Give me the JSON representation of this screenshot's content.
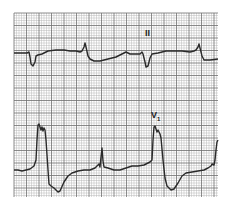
{
  "chart_data": {
    "type": "line",
    "title": "",
    "xlabel": "",
    "ylabel": "",
    "grid": true,
    "grid_area": {
      "x0": 14,
      "y0": 13,
      "x1": 218,
      "y1": 197,
      "minor_step": 2.5,
      "major_step": 12.5
    },
    "colors": {
      "grid_minor": "#b8b8b8",
      "grid_major": "#6e6e6e",
      "trace": "#2a2a2a",
      "paper": "#ffffff"
    },
    "series": [
      {
        "name": "II",
        "label": "II",
        "label_pos": {
          "x": 145,
          "y": 29
        },
        "points": [
          [
            14,
            53
          ],
          [
            27,
            53
          ],
          [
            29,
            52
          ],
          [
            30,
            57
          ],
          [
            31,
            64
          ],
          [
            33,
            66
          ],
          [
            35,
            62
          ],
          [
            36,
            56
          ],
          [
            38,
            55
          ],
          [
            42,
            54
          ],
          [
            48,
            51
          ],
          [
            56,
            50
          ],
          [
            64,
            50
          ],
          [
            70,
            51
          ],
          [
            76,
            51
          ],
          [
            80,
            52
          ],
          [
            82,
            51
          ],
          [
            84,
            47
          ],
          [
            85,
            43
          ],
          [
            86,
            47
          ],
          [
            88,
            56
          ],
          [
            90,
            59
          ],
          [
            94,
            61
          ],
          [
            100,
            61
          ],
          [
            108,
            59
          ],
          [
            116,
            57
          ],
          [
            122,
            54
          ],
          [
            126,
            52
          ],
          [
            130,
            54
          ],
          [
            136,
            54
          ],
          [
            140,
            54
          ],
          [
            142,
            52
          ],
          [
            143,
            54
          ],
          [
            145,
            62
          ],
          [
            146,
            67
          ],
          [
            148,
            66
          ],
          [
            150,
            58
          ],
          [
            152,
            54
          ],
          [
            158,
            53
          ],
          [
            166,
            51
          ],
          [
            174,
            51
          ],
          [
            182,
            51
          ],
          [
            190,
            52
          ],
          [
            194,
            51
          ],
          [
            196,
            50
          ],
          [
            198,
            47
          ],
          [
            199,
            44
          ],
          [
            200,
            48
          ],
          [
            202,
            56
          ],
          [
            204,
            60
          ],
          [
            210,
            60
          ],
          [
            218,
            59
          ]
        ]
      },
      {
        "name": "V1",
        "label": "V",
        "label_sub": "1",
        "label_pos": {
          "x": 151,
          "y": 111
        },
        "points": [
          [
            14,
            170
          ],
          [
            18,
            170
          ],
          [
            22,
            171
          ],
          [
            26,
            170
          ],
          [
            30,
            169
          ],
          [
            34,
            166
          ],
          [
            36,
            160
          ],
          [
            37,
            140
          ],
          [
            38,
            125
          ],
          [
            39,
            124
          ],
          [
            41,
            130
          ],
          [
            42,
            127
          ],
          [
            43,
            131
          ],
          [
            44,
            128
          ],
          [
            45,
            130
          ],
          [
            46,
            140
          ],
          [
            48,
            170
          ],
          [
            49,
            184
          ],
          [
            51,
            186
          ],
          [
            54,
            188
          ],
          [
            58,
            192
          ],
          [
            60,
            191
          ],
          [
            64,
            182
          ],
          [
            68,
            176
          ],
          [
            72,
            173
          ],
          [
            78,
            171
          ],
          [
            84,
            170
          ],
          [
            90,
            170
          ],
          [
            95,
            168
          ],
          [
            97,
            166
          ],
          [
            99,
            164
          ],
          [
            100,
            167
          ],
          [
            101,
            157
          ],
          [
            102,
            148
          ],
          [
            103,
            161
          ],
          [
            104,
            167
          ],
          [
            108,
            168
          ],
          [
            114,
            170
          ],
          [
            120,
            170
          ],
          [
            126,
            168
          ],
          [
            132,
            166
          ],
          [
            138,
            166
          ],
          [
            144,
            165
          ],
          [
            150,
            162
          ],
          [
            152,
            160
          ],
          [
            153,
            140
          ],
          [
            154,
            127
          ],
          [
            155,
            126
          ],
          [
            157,
            132
          ],
          [
            158,
            130
          ],
          [
            160,
            134
          ],
          [
            161,
            138
          ],
          [
            163,
            160
          ],
          [
            165,
            178
          ],
          [
            167,
            186
          ],
          [
            171,
            190
          ],
          [
            174,
            189
          ],
          [
            178,
            183
          ],
          [
            182,
            176
          ],
          [
            186,
            173
          ],
          [
            192,
            172
          ],
          [
            198,
            171
          ],
          [
            204,
            170
          ],
          [
            208,
            168
          ],
          [
            211,
            166
          ],
          [
            212,
            164
          ],
          [
            214,
            165
          ],
          [
            215,
            160
          ],
          [
            216,
            150
          ],
          [
            217,
            142
          ],
          [
            218,
            140
          ]
        ]
      }
    ]
  }
}
